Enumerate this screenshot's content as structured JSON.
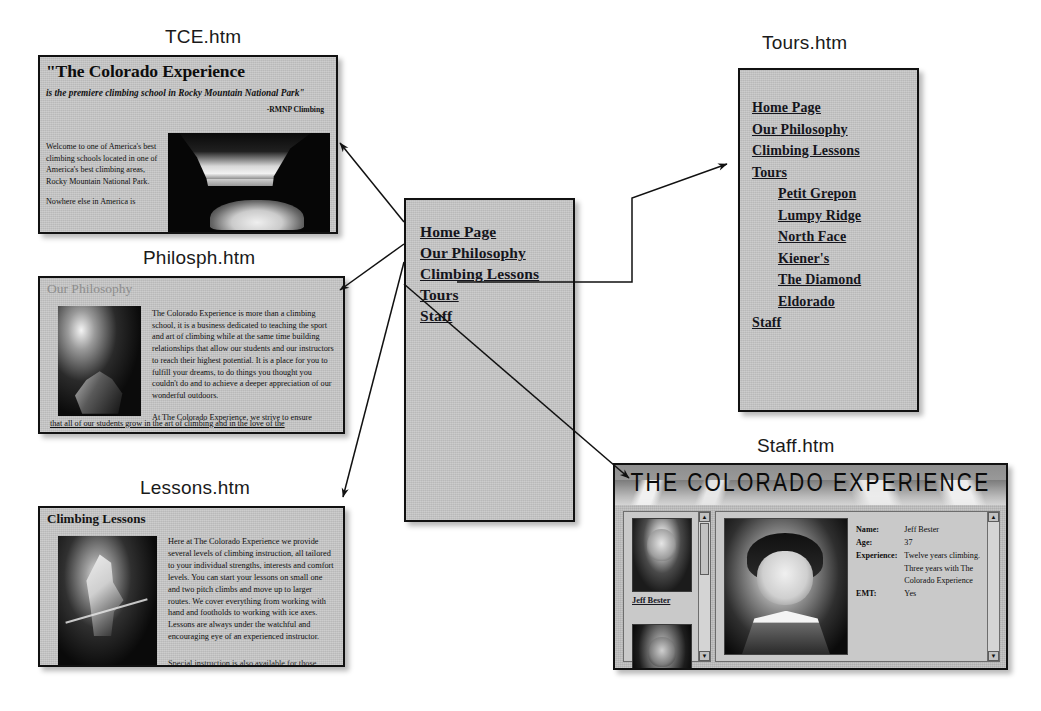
{
  "captions": {
    "tce": "TCE.htm",
    "philosophy": "Philosph.htm",
    "lessons": "Lessons.htm",
    "tours": "Tours.htm",
    "staff": "Staff.htm"
  },
  "center_nav": {
    "links": [
      {
        "label": "Home Page"
      },
      {
        "label": "Our Philosophy"
      },
      {
        "label": "Climbing Lessons"
      },
      {
        "label": "Tours"
      },
      {
        "label": "Staff"
      }
    ]
  },
  "tours_nav": {
    "links": [
      {
        "label": "Home Page",
        "sub": false
      },
      {
        "label": "Our Philosophy",
        "sub": false
      },
      {
        "label": "Climbing Lessons",
        "sub": false
      },
      {
        "label": "Tours",
        "sub": false
      },
      {
        "label": "Petit Grepon",
        "sub": true
      },
      {
        "label": "Lumpy Ridge",
        "sub": true
      },
      {
        "label": "North Face",
        "sub": true
      },
      {
        "label": "Kiener's",
        "sub": true
      },
      {
        "label": "The Diamond",
        "sub": true
      },
      {
        "label": "Eldorado",
        "sub": true
      },
      {
        "label": "Staff",
        "sub": false
      }
    ]
  },
  "tce_page": {
    "headline": "\"The Colorado Experience",
    "subhead": "is the premiere climbing school in Rocky Mountain National Park\"",
    "attribution": "-RMNP Climbing",
    "paragraph1": "Welcome to one of America's best climbing schools located in one of America's best climbing areas, Rocky Mountain National Park.",
    "paragraph2": "Nowhere else in America is",
    "photo_alt": "mountain-lake-photo"
  },
  "philosophy_page": {
    "title": "Our Philosophy",
    "paragraph1": "The Colorado Experience is more than a climbing school, it is a business dedicated to teaching the sport and art of climbing while at the same time building relationships that allow our students and our instructors to reach their highest potential. It is a place for you to fulfill your dreams, to do things you thought you couldn't do and to achieve a deeper appreciation of our wonderful outdoors.",
    "paragraph2": "At The Colorado Experience, we strive to ensure",
    "paragraph3": "that all of our students grow in the art of climbing and in the love of the",
    "photo_alt": "climber-photo"
  },
  "lessons_page": {
    "title": "Climbing Lessons",
    "paragraph1": "Here at The Colorado Experience we provide several levels of climbing instruction, all tailored to your individual strengths, interests and comfort levels.  You can start your lessons on small one and two pitch climbs and move up to larger routes.  We cover everything from working with hand and footholds to working with ice axes.  Lessons are always under the watchful and encouraging eye of an experienced instructor.",
    "paragraph2": "Special instruction is also available for those",
    "photo_alt": "ice-climber-photo"
  },
  "staff_page": {
    "banner": "THE COLORADO EXPERIENCE",
    "thumb_label": "Jeff Bester",
    "info": [
      {
        "key": "Name:",
        "value": "Jeff Bester"
      },
      {
        "key": "Age:",
        "value": "37"
      },
      {
        "key": "Experience:",
        "value": "Twelve years climbing. Three years with The Colorado Experience"
      },
      {
        "key": "EMT:",
        "value": "Yes"
      }
    ],
    "scroll_up": "▲",
    "scroll_down": "▼",
    "photo_alt": "jeff-bester-portrait"
  },
  "colors": {
    "panel_fill": "#c6c6c6",
    "panel_border": "#111111",
    "link_text": "#15151c",
    "caption_text": "#1a1a1a",
    "page_background": "#ffffff"
  }
}
